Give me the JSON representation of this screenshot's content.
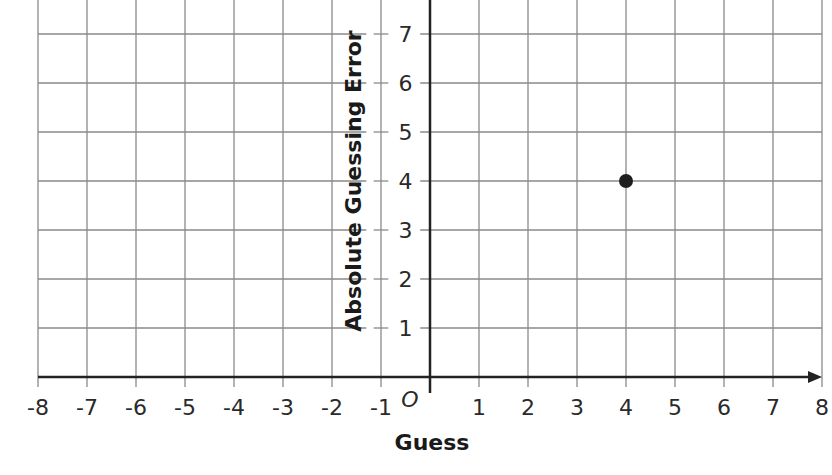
{
  "chart_data": {
    "type": "scatter",
    "title": "",
    "xlabel": "Guess",
    "ylabel": "Absolute Guessing Error",
    "origin_label": "O",
    "xlim": [
      -8,
      8
    ],
    "ylim": [
      0,
      7.7
    ],
    "x_ticks": [
      -8,
      -7,
      -6,
      -5,
      -4,
      -3,
      -2,
      -1,
      1,
      2,
      3,
      4,
      5,
      6,
      7,
      8
    ],
    "y_ticks": [
      1,
      2,
      3,
      4,
      5,
      6,
      7
    ],
    "grid": true,
    "legend": null,
    "series": [
      {
        "name": "points",
        "points": [
          {
            "x": 4,
            "y": 4
          }
        ]
      }
    ]
  },
  "colors": {
    "grid": "#8a8a8a",
    "axis": "#222222",
    "point": "#1e1e1e"
  }
}
